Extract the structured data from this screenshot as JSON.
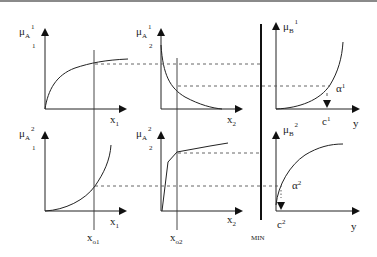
{
  "diagram": {
    "panels": {
      "top_left": {
        "ylabel": "μ",
        "ysub": "A",
        "ysup": "1",
        "ysubsub": "1",
        "xlabel": "x",
        "xsub": "1"
      },
      "top_mid": {
        "ylabel": "μ",
        "ysub": "A",
        "ysup": "1",
        "ysubsub": "2",
        "xlabel": "x",
        "xsub": "2"
      },
      "top_right": {
        "ylabel": "μ",
        "ysub": "B",
        "ysup": "1",
        "xlabel": "y",
        "point": "c",
        "point_sup": "1",
        "alpha": "α",
        "alpha_sup": "1"
      },
      "bottom_left": {
        "ylabel": "μ",
        "ysub": "A",
        "ysup": "2",
        "ysubsub": "1",
        "xlabel": "x",
        "xsub": "1",
        "marker": "x",
        "marker_sub": "o1"
      },
      "bottom_mid": {
        "ylabel": "μ",
        "ysub": "A",
        "ysup": "2",
        "ysubsub": "2",
        "xlabel": "x",
        "xsub": "2",
        "marker": "x",
        "marker_sub": "o2"
      },
      "bottom_right": {
        "ylabel": "μ",
        "ysub": "B",
        "ysup": "2",
        "xlabel": "y",
        "point": "c",
        "point_sup": "2",
        "alpha": "α",
        "alpha_sup": "2"
      }
    },
    "min_label": "MIN"
  }
}
